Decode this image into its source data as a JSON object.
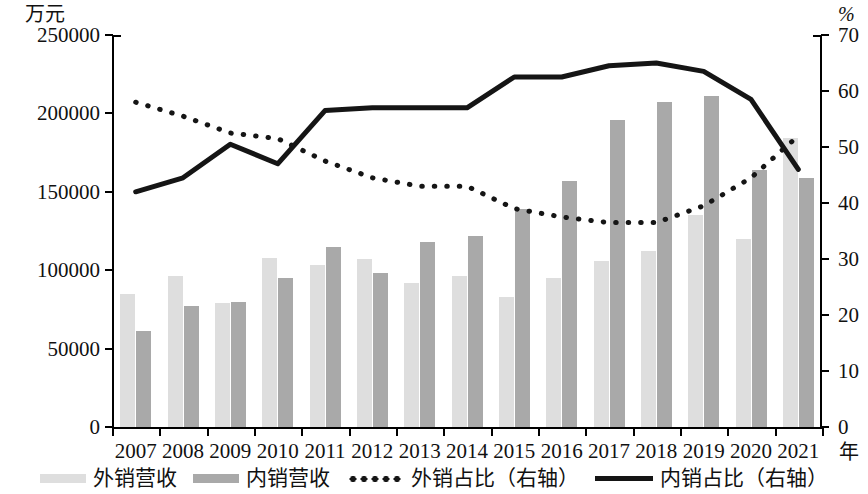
{
  "chart_data": {
    "type": "bar",
    "title": "",
    "xlabel": "年",
    "ylabel": "万元",
    "y2label": "%",
    "ylim": [
      0,
      250000
    ],
    "y2lim": [
      0,
      70
    ],
    "ytick_labels": [
      "250000",
      "200000",
      "150000",
      "100000",
      "50000",
      "0"
    ],
    "ytick_values": [
      250000,
      200000,
      150000,
      100000,
      50000,
      0
    ],
    "y2tick_labels": [
      "70",
      "60",
      "50",
      "40",
      "30",
      "20",
      "10",
      "0"
    ],
    "y2tick_values": [
      70,
      60,
      50,
      40,
      30,
      20,
      10,
      0
    ],
    "grid": false,
    "legend_position": "bottom",
    "categories": [
      "2007",
      "2008",
      "2009",
      "2010",
      "2011",
      "2012",
      "2013",
      "2014",
      "2015",
      "2016",
      "2017",
      "2018",
      "2019",
      "2020",
      "2021"
    ],
    "series": [
      {
        "name": "外销营收",
        "type": "bar",
        "axis": "left",
        "color": "#dedede",
        "values": [
          85000,
          96000,
          79000,
          108000,
          103000,
          107000,
          92000,
          96000,
          83000,
          95000,
          106000,
          112000,
          135000,
          120000,
          184000
        ]
      },
      {
        "name": "内销营收",
        "type": "bar",
        "axis": "left",
        "color": "#a9a9a9",
        "values": [
          61000,
          77000,
          80000,
          95000,
          115000,
          98000,
          118000,
          122000,
          139000,
          157000,
          196000,
          207000,
          211000,
          164000,
          159000
        ]
      },
      {
        "name": "外销占比（右轴）",
        "type": "line",
        "style": "dotted",
        "axis": "right",
        "color": "#151515",
        "values": [
          58.0,
          55.5,
          52.5,
          51.5,
          47.5,
          44.5,
          43.0,
          43.0,
          39.0,
          37.5,
          36.5,
          36.5,
          39.5,
          44.5,
          52.0
        ]
      },
      {
        "name": "内销占比（右轴）",
        "type": "line",
        "style": "solid",
        "axis": "right",
        "color": "#151515",
        "values": [
          42.0,
          44.5,
          50.5,
          47.0,
          56.5,
          57.0,
          57.0,
          57.0,
          62.5,
          62.5,
          64.5,
          65.0,
          63.5,
          58.5,
          46.0
        ]
      }
    ]
  },
  "legend": {
    "items": [
      {
        "label": "外销营收",
        "swatch": "bar-light"
      },
      {
        "label": "内销营收",
        "swatch": "bar-dark"
      },
      {
        "label": "外销占比（右轴）",
        "swatch": "line-dotted"
      },
      {
        "label": "内销占比（右轴）",
        "swatch": "line-solid"
      }
    ]
  }
}
